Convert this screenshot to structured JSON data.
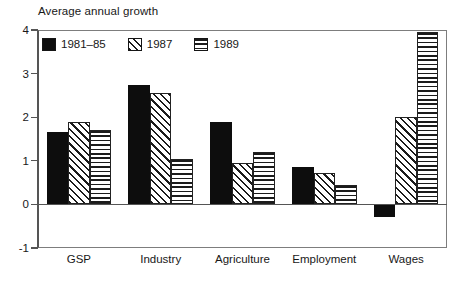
{
  "chart_data": {
    "type": "bar",
    "title": "Average annual growth",
    "xlabel": "",
    "ylabel": "",
    "ylim": [
      -1,
      4
    ],
    "yticks": [
      "4",
      "3",
      "2",
      "1",
      "0",
      "-1"
    ],
    "grid": false,
    "legend_position": "top-left-inside",
    "categories": [
      "GSP",
      "Industry",
      "Agriculture",
      "Employment",
      "Wages"
    ],
    "series": [
      {
        "name": "1981–85",
        "pattern": "solid-black",
        "values": [
          1.67,
          2.73,
          1.9,
          0.85,
          -0.3
        ]
      },
      {
        "name": "1987",
        "pattern": "diagonal-hatch",
        "values": [
          1.9,
          2.55,
          0.95,
          0.72,
          2.0
        ]
      },
      {
        "name": "1989",
        "pattern": "horizontal-lines",
        "values": [
          1.7,
          1.05,
          1.2,
          0.45,
          3.95
        ]
      }
    ]
  },
  "colors": {
    "series_1981_85": "#0d0d0d",
    "series_1987": "#ffffff",
    "series_1989": "#ffffff",
    "axis": "#555555",
    "frame": "#7d7d7d",
    "background": "#ffffff",
    "text": "#181818"
  }
}
